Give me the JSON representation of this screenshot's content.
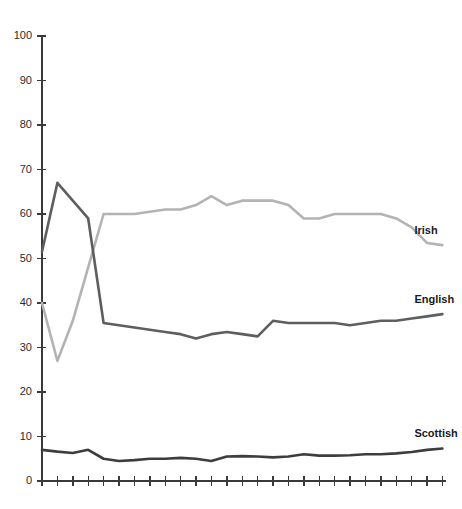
{
  "chart_data": {
    "type": "line",
    "title": "",
    "subtitle": "",
    "xlabel": "",
    "ylabel": "",
    "ylim": [
      0,
      100
    ],
    "ytick_step": 10,
    "ytick_labels": [
      "0",
      "10",
      "20",
      "30",
      "40",
      "50",
      "60",
      "70",
      "80",
      "90",
      "100"
    ],
    "xtick_labels": [],
    "xtick_count": 27,
    "grid": false,
    "legend_position": "end-of-line",
    "x": [
      1,
      2,
      3,
      4,
      5,
      6,
      7,
      8,
      9,
      10,
      11,
      12,
      13,
      14,
      15,
      16,
      17,
      18,
      19,
      20,
      21,
      22,
      23,
      24,
      25,
      26,
      27
    ],
    "series": [
      {
        "name": "Irish",
        "color": "#b3b3b3",
        "label": "Irish",
        "label_value": "53",
        "values": [
          40,
          27,
          36,
          48,
          60,
          60,
          60,
          60.5,
          61,
          61,
          62,
          64,
          62,
          63,
          63,
          63,
          62,
          59,
          59,
          60,
          60,
          60,
          60,
          59,
          57,
          53.5,
          53
        ]
      },
      {
        "name": "English",
        "color": "#5e5e5e",
        "label": "English",
        "label_value": "37",
        "values": [
          51.5,
          67,
          63,
          59,
          35.5,
          35,
          34.5,
          34,
          33.5,
          33,
          32,
          33,
          33.5,
          33,
          32.5,
          36,
          35.5,
          35.5,
          35.5,
          35.5,
          35,
          35.5,
          36,
          36,
          36.5,
          37,
          37.5
        ]
      },
      {
        "name": "Scottish",
        "color": "#3d3d3d",
        "label": "Scottish",
        "label_value": "7",
        "values": [
          7,
          6.6,
          6.3,
          7,
          5,
          4.5,
          4.7,
          5,
          5,
          5.2,
          5,
          4.5,
          5.5,
          5.6,
          5.5,
          5.3,
          5.5,
          6,
          5.7,
          5.7,
          5.8,
          6,
          6,
          6.2,
          6.5,
          7,
          7.3
        ]
      }
    ]
  },
  "colors": {
    "axis": "#3a3a3a",
    "background": "#ffffff",
    "label_text": "#1a1a1a"
  }
}
